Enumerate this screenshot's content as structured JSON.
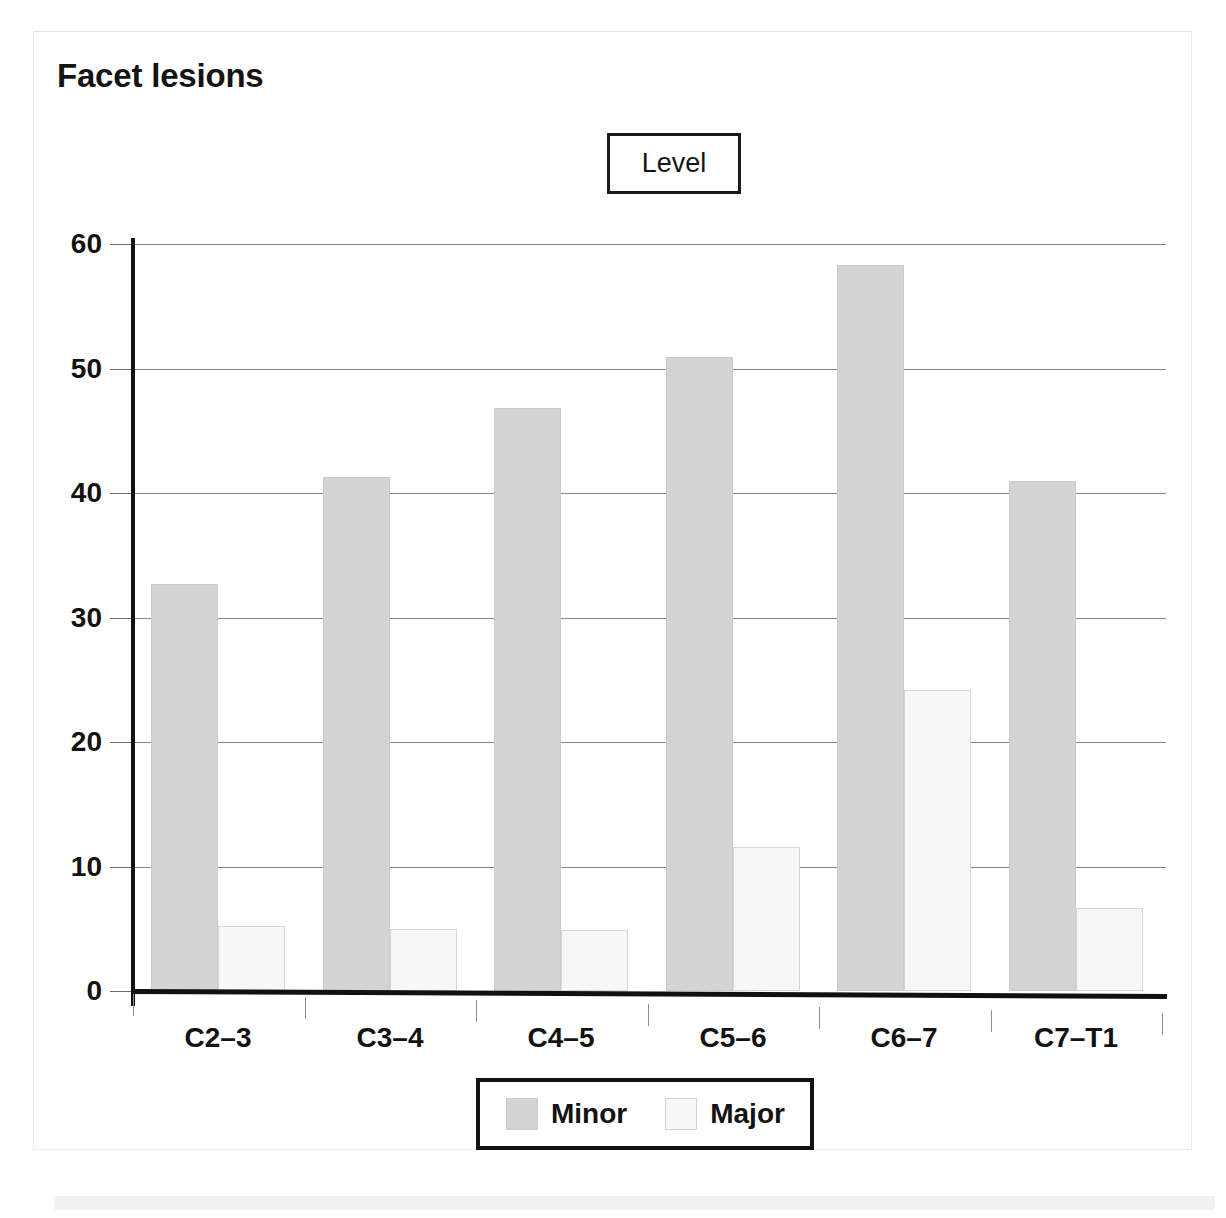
{
  "card": {
    "title": "Facet lesions"
  },
  "group_label_box": {
    "label": "Level"
  },
  "legend": {
    "entries": [
      {
        "label": "Minor",
        "color": "#d4d4d4"
      },
      {
        "label": "Major",
        "color": "#f7f7f7"
      }
    ]
  },
  "chart_data": {
    "type": "bar",
    "title": "Facet lesions",
    "xlabel": "Level",
    "ylabel": "",
    "categories": [
      "C2–3",
      "C3–4",
      "C4–5",
      "C5–6",
      "C6–7",
      "C7–T1"
    ],
    "series": [
      {
        "name": "Minor",
        "color": "#d4d4d4",
        "values": [
          32.7,
          41.3,
          46.8,
          50.9,
          58.3,
          41.0
        ]
      },
      {
        "name": "Major",
        "color": "#f7f7f7",
        "values": [
          5.2,
          5.0,
          4.9,
          11.6,
          24.2,
          6.7
        ]
      }
    ],
    "ylim": [
      0,
      60
    ],
    "yticks": [
      0,
      10,
      20,
      30,
      40,
      50,
      60
    ],
    "ytick_labels": [
      "0",
      "10",
      "20",
      "30",
      "40",
      "50",
      "60"
    ],
    "grid": true,
    "grid_axis": "y",
    "legend_position": "bottom"
  }
}
